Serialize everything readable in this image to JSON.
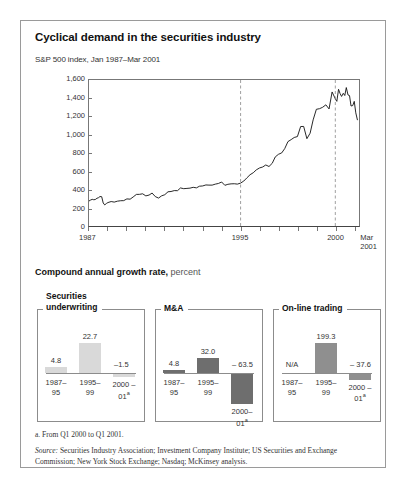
{
  "exhibit": {
    "title": "Cyclical demand in the securities industry",
    "subtitle": "S&P 500 index, Jan 1987–Mar 2001",
    "cagr_heading": "Compound annual growth rate,",
    "cagr_unit": "percent",
    "footnote": "a. From Q1 2000 to Q1 2001.",
    "source_label": "Source:",
    "source_text": " Securities Industry Association; Investment Company Institute; US Securities and Exchange Commission;  New York Stock Exchange; Nasdaq; McKinsey analysis."
  },
  "chart_data": [
    {
      "type": "line",
      "title": "S&P 500 index, Jan 1987–Mar 2001",
      "xlabel": "",
      "ylabel": "",
      "ylim": [
        0,
        1600
      ],
      "xlim": [
        1987,
        2001.25
      ],
      "grid": false,
      "legend": "none",
      "ytick_labels": [
        "1,600",
        "1,400",
        "1,200",
        "1,000",
        "800",
        "600",
        "400",
        "200",
        "0"
      ],
      "ytick_values": [
        1600,
        1400,
        1200,
        1000,
        800,
        600,
        400,
        200,
        0
      ],
      "xtick_values": [
        1987,
        1988,
        1989,
        1990,
        1991,
        1992,
        1993,
        1994,
        1995,
        1996,
        1997,
        1998,
        1999,
        2000,
        2001
      ],
      "xtick_labels": [
        "1987",
        "",
        "",
        "",
        "",
        "",
        "",
        "",
        "1995",
        "",
        "",
        "",
        "",
        "2000",
        "Mar 2001"
      ],
      "annotations": [
        {
          "type": "vline",
          "x": 1995,
          "style": "dashed"
        },
        {
          "type": "vline",
          "x": 2000,
          "style": "dashed"
        }
      ],
      "series": [
        {
          "name": "S&P 500 index",
          "x": [
            1987.0,
            1987.08,
            1987.17,
            1987.25,
            1987.33,
            1987.42,
            1987.5,
            1987.58,
            1987.67,
            1987.75,
            1987.83,
            1987.92,
            1988.0,
            1988.17,
            1988.33,
            1988.5,
            1988.67,
            1988.83,
            1989.0,
            1989.17,
            1989.33,
            1989.5,
            1989.67,
            1989.83,
            1990.0,
            1990.17,
            1990.33,
            1990.5,
            1990.67,
            1990.83,
            1991.0,
            1991.17,
            1991.33,
            1991.5,
            1991.67,
            1991.83,
            1992.0,
            1992.17,
            1992.33,
            1992.5,
            1992.67,
            1992.83,
            1993.0,
            1993.17,
            1993.33,
            1993.5,
            1993.67,
            1993.83,
            1994.0,
            1994.17,
            1994.33,
            1994.5,
            1994.67,
            1994.83,
            1995.0,
            1995.17,
            1995.33,
            1995.5,
            1995.67,
            1995.83,
            1996.0,
            1996.17,
            1996.33,
            1996.5,
            1996.67,
            1996.83,
            1997.0,
            1997.17,
            1997.33,
            1997.5,
            1997.67,
            1997.83,
            1998.0,
            1998.17,
            1998.33,
            1998.5,
            1998.67,
            1998.83,
            1999.0,
            1999.17,
            1999.33,
            1999.5,
            1999.67,
            1999.83,
            2000.0,
            2000.08,
            2000.17,
            2000.25,
            2000.33,
            2000.42,
            2000.5,
            2000.58,
            2000.67,
            2000.75,
            2000.83,
            2000.92,
            2001.0,
            2001.08,
            2001.17
          ],
          "y": [
            274,
            284,
            292,
            288,
            290,
            304,
            310,
            323,
            321,
            252,
            231,
            247,
            257,
            268,
            262,
            272,
            277,
            278,
            297,
            294,
            318,
            346,
            347,
            353,
            330,
            339,
            361,
            322,
            306,
            330,
            343,
            375,
            378,
            388,
            387,
            417,
            409,
            412,
            415,
            424,
            418,
            436,
            439,
            450,
            448,
            448,
            459,
            466,
            482,
            446,
            457,
            462,
            463,
            459,
            470,
            493,
            527,
            562,
            584,
            615,
            636,
            647,
            669,
            652,
            687,
            757,
            786,
            801,
            848,
            925,
            947,
            970,
            980,
            1090,
            1091,
            957,
            1017,
            1163,
            1279,
            1286,
            1301,
            1328,
            1283,
            1469,
            1394,
            1366,
            1498,
            1452,
            1420,
            1454,
            1430,
            1517,
            1436,
            1429,
            1315,
            1320,
            1366,
            1240,
            1160
          ]
        }
      ]
    },
    {
      "type": "bar",
      "title": "Securities underwriting",
      "ylabel": "percent",
      "categories": [
        "1987–95",
        "1995–99",
        "2000–01"
      ],
      "category_lines": [
        [
          "1987–",
          "95"
        ],
        [
          "1995–",
          "99"
        ],
        [
          "2000 –",
          "01"
        ]
      ],
      "category_superscripts": [
        "",
        "",
        "a"
      ],
      "values": [
        4.8,
        22.7,
        -1.5
      ],
      "value_labels": [
        "4.8",
        "22.7",
        "–1.5"
      ],
      "bar_color": "#d9d9d9"
    },
    {
      "type": "bar",
      "title": "M&A",
      "ylabel": "percent",
      "categories": [
        "1987–95",
        "1995–99",
        "2000–01"
      ],
      "category_lines": [
        [
          "1987–",
          "95"
        ],
        [
          "1995–",
          "99"
        ],
        [
          "2000–",
          "01"
        ]
      ],
      "category_superscripts": [
        "",
        "",
        "a"
      ],
      "values": [
        4.8,
        32.0,
        -63.5
      ],
      "value_labels": [
        "4.8",
        "32.0",
        "– 63.5"
      ],
      "bar_color": "#6e6e6e"
    },
    {
      "type": "bar",
      "title": "On-line trading",
      "ylabel": "percent",
      "categories": [
        "1987–95",
        "1995–99",
        "2000–01"
      ],
      "category_lines": [
        [
          "1987–",
          "95"
        ],
        [
          "1995–",
          "99"
        ],
        [
          "2000 –",
          "01"
        ]
      ],
      "category_superscripts": [
        "",
        "",
        "a"
      ],
      "values": [
        null,
        199.3,
        -37.6
      ],
      "value_labels": [
        "N/A",
        "199.3",
        "– 37.6"
      ],
      "bar_color": "#8f8f8f"
    }
  ]
}
